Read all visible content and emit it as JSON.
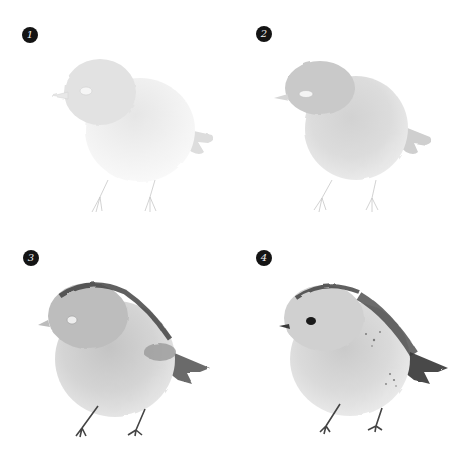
{
  "steps": [
    {
      "number": "1",
      "description": "Light first wash of the body with pencil legs"
    },
    {
      "number": "2",
      "description": "Second wash darkening head, back and wing"
    },
    {
      "number": "3",
      "description": "Dark accents on crown, back and tail; legs painted"
    },
    {
      "number": "4",
      "description": "Final details: eye, beak, feather speckles and tail"
    }
  ],
  "colors": {
    "badge": "#141414",
    "background": "#ffffff"
  }
}
